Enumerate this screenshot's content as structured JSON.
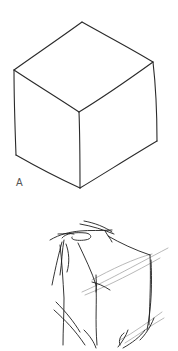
{
  "figure": {
    "width": 178,
    "height": 351,
    "background": "#ffffff"
  },
  "cube_a": {
    "label": "A",
    "stroke": "#2a2a2a",
    "stroke_width": 1.1,
    "vertices": {
      "top": [
        82,
        22
      ],
      "upper_left": [
        14,
        70
      ],
      "upper_right": [
        153,
        62
      ],
      "front_top": [
        79,
        112
      ],
      "lower_left": [
        16,
        155
      ],
      "lower_right": [
        157,
        141
      ],
      "bottom": [
        80,
        188
      ]
    },
    "edges": [
      "M14,70 C35,55 60,38 82,22",
      "M82,22 C105,35 130,48 153,62",
      "M14,70 C35,84 58,98 79,112",
      "M79,112 C102,98 128,80 153,62",
      "M14,70 C14,98 15,128 16,155",
      "M153,62 C156,88 157,115 157,141",
      "M79,112 C80,138 80,163 80,188",
      "M16,155 C37,167 58,178 80,188",
      "M80,188 C105,173 130,157 157,141"
    ]
  },
  "cube_b": {
    "stroke": "#1e1e1e",
    "guide_stroke": "#9a9a9a",
    "stroke_width": 0.9,
    "sketch_lines": [
      "M50,240 C60,234 70,232 80,231 C90,230 100,231 112,230",
      "M80,224 C92,226 104,230 114,234",
      "M84,221 C95,223 105,227 112,232",
      "M62,238 C66,233 75,232 86,233 C92,234 93,239 85,240 C78,241 70,240 72,237",
      "M58,234 C64,234 70,233 74,234",
      "M105,231 C108,236 110,238 112,242",
      "M108,236 C120,243 135,250 150,255",
      "M62,242 C59,253 56,265 52,285",
      "M64,240 C62,250 62,262 60,275",
      "M60,245 C62,262 63,280 64,298 C64,315 63,330 63,345",
      "M66,244 C69,252 70,262 67,272",
      "M78,243 C85,258 92,272 96,285",
      "M96,285 C97,302 95,320 97,345",
      "M150,255 C151,275 150,300 149,325",
      "M151,260 C152,280 152,305 147,330",
      "M145,330 C140,337 132,343 123,348",
      "M154,318 C150,328 145,335 140,340",
      "M54,310 C65,320 75,330 85,345",
      "M56,302 C66,312 74,322 80,332",
      "M84,330 C90,336 94,342 96,348",
      "M118,347 C122,342 126,336 128,330",
      "M120,345 C118,340 121,335 124,333",
      "M92,282 C97,283 104,286 110,290",
      "M96,275 C96,280 97,286 96,292"
    ],
    "guide_lines": [
      "M82,292 C105,282 130,268 168,248",
      "M85,295 C110,285 135,272 160,258",
      "M120,340 C135,332 148,322 162,312",
      "M125,343 C138,335 150,326 164,318",
      "M92,280 C110,270 135,258 152,254"
    ]
  }
}
